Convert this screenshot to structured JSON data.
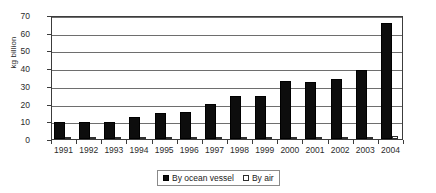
{
  "chart_data": {
    "type": "bar",
    "title": "",
    "xlabel": "",
    "ylabel": "kg billion",
    "ylim": [
      0,
      70
    ],
    "yticks": [
      0,
      10,
      20,
      30,
      40,
      50,
      60,
      70
    ],
    "ytick_labels": [
      "0",
      "10",
      "20",
      "30",
      "40",
      "50",
      "60",
      "70"
    ],
    "grid": true,
    "legend_position": "bottom",
    "categories": [
      "1991",
      "1992",
      "1993",
      "1994",
      "1995",
      "1996",
      "1997",
      "1998",
      "1999",
      "2000",
      "2001",
      "2002",
      "2003",
      "2004"
    ],
    "series": [
      {
        "name": "By ocean vessel",
        "color": "#0d0d0d",
        "values": [
          9.5,
          9.8,
          9.6,
          12.5,
          14.5,
          15.3,
          20.0,
          24.5,
          24.5,
          33.0,
          32.0,
          34.0,
          39.0,
          65.5
        ]
      },
      {
        "name": "By air",
        "color": "#ffffff",
        "values": [
          0.5,
          0.5,
          0.5,
          0.6,
          0.7,
          0.7,
          0.8,
          0.9,
          0.9,
          1.1,
          1.1,
          1.2,
          1.3,
          1.6
        ]
      }
    ]
  },
  "legend": {
    "items": [
      {
        "label": "By ocean vessel",
        "swatch": "filled-black-square"
      },
      {
        "label": "By air",
        "swatch": "open-white-square"
      }
    ]
  }
}
